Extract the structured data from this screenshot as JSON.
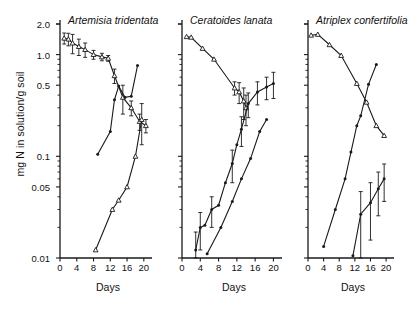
{
  "figure": {
    "ylabel": "mg N in solution/g soil",
    "xlabel": "Days",
    "y_tick_labels": [
      "2.0",
      "1.0",
      "0.5",
      "0.1",
      "0.05",
      "0.01"
    ],
    "x_tick_labels": [
      "0",
      "4",
      "8",
      "12",
      "16",
      "20"
    ]
  },
  "panels": [
    {
      "title": "Artemisia tridentata"
    },
    {
      "title": "Ceratoides lanata"
    },
    {
      "title": "Atriplex confertifolia"
    }
  ],
  "chart_data": {
    "type": "line",
    "title": "",
    "xlabel": "Days",
    "ylabel": "mg N in solution/g soil",
    "yscale": "log",
    "ylim": [
      0.01,
      2.0
    ],
    "xlim": [
      0,
      21
    ],
    "y_ticks": [
      2.0,
      1.0,
      0.5,
      0.1,
      0.05,
      0.01
    ],
    "x_ticks": [
      0,
      4,
      8,
      12,
      16,
      20
    ],
    "grid": false,
    "legend": "none",
    "panels": [
      {
        "title": "Artemisia tridentata",
        "series": [
          {
            "name": "declining-series",
            "marker": "open-triangle",
            "x": [
              1.0,
              2.0,
              3.0,
              4.5,
              6.0,
              8.0,
              10.0,
              11.5,
              13.0,
              15.0,
              17.0,
              19.0,
              20.5
            ],
            "y": [
              1.45,
              1.42,
              1.3,
              1.2,
              1.12,
              1.0,
              0.95,
              0.92,
              0.62,
              0.38,
              0.3,
              0.22,
              0.2
            ],
            "yerr": [
              0.18,
              0.2,
              0.28,
              0.22,
              0.18,
              0.1,
              0.08,
              0.06,
              0.1,
              0.12,
              0.05,
              0.04,
              0.03
            ]
          },
          {
            "name": "rising-series-upper",
            "marker": "filled-circle",
            "x": [
              9.0,
              12.0,
              13.0,
              14.0,
              15.5,
              17.0,
              18.5
            ],
            "y": [
              0.105,
              0.175,
              0.36,
              0.49,
              0.38,
              0.39,
              0.78
            ],
            "yerr": [
              0.0,
              0.0,
              0.0,
              0.0,
              0.0,
              0.0,
              0.0
            ]
          },
          {
            "name": "rising-series-lower",
            "marker": "open-triangle",
            "x": [
              8.5,
              12.5,
              14.0,
              16.0,
              18.0,
              19.5
            ],
            "y": [
              0.012,
              0.03,
              0.037,
              0.05,
              0.1,
              0.23
            ],
            "yerr": [
              0.0,
              0.0,
              0.0,
              0.0,
              0.0,
              0.1
            ]
          }
        ]
      },
      {
        "title": "Ceratoides lanata",
        "series": [
          {
            "name": "declining-series",
            "marker": "open-triangle",
            "x": [
              1.0,
              2.0,
              4.5,
              7.0,
              11.5,
              12.5,
              13.5,
              14.0
            ],
            "y": [
              1.5,
              1.48,
              1.15,
              0.9,
              0.47,
              0.43,
              0.35,
              0.3
            ],
            "yerr": [
              0.0,
              0.0,
              0.0,
              0.0,
              0.07,
              0.1,
              0.12,
              0.1
            ]
          },
          {
            "name": "rising-series-upper",
            "marker": "filled-circle",
            "x": [
              3.0,
              4.0,
              5.0,
              6.5,
              8.0,
              9.5,
              11.0,
              12.0,
              13.0,
              14.5,
              16.5,
              18.5,
              20.0
            ],
            "y": [
              0.012,
              0.02,
              0.021,
              0.03,
              0.033,
              0.055,
              0.085,
              0.13,
              0.185,
              0.33,
              0.43,
              0.48,
              0.52
            ],
            "yerr": [
              0.006,
              0.008,
              0.0,
              0.01,
              0.0,
              0.0,
              0.03,
              0.0,
              0.06,
              0.09,
              0.11,
              0.12,
              0.15
            ]
          },
          {
            "name": "rising-series-lower",
            "marker": "filled-circle",
            "x": [
              5.5,
              8.5,
              11.0,
              13.0,
              15.0,
              17.0,
              18.5
            ],
            "y": [
              0.011,
              0.02,
              0.036,
              0.06,
              0.095,
              0.175,
              0.23
            ],
            "yerr": [
              0.0,
              0.0,
              0.0,
              0.0,
              0.0,
              0.0,
              0.0
            ]
          }
        ]
      },
      {
        "title": "Atriplex confertifolia",
        "series": [
          {
            "name": "declining-series",
            "marker": "open-triangle",
            "x": [
              0.8,
              2.5,
              5.5,
              8.5,
              12.5,
              15.0,
              17.5,
              19.5
            ],
            "y": [
              1.55,
              1.58,
              1.25,
              0.98,
              0.52,
              0.34,
              0.2,
              0.16
            ],
            "yerr": [
              0.0,
              0.0,
              0.0,
              0.0,
              0.0,
              0.0,
              0.0,
              0.0
            ]
          },
          {
            "name": "rising-series-upper",
            "marker": "filled-circle",
            "x": [
              4.0,
              7.0,
              9.5,
              11.0,
              12.5,
              13.5,
              15.5,
              17.5
            ],
            "y": [
              0.013,
              0.03,
              0.06,
              0.11,
              0.2,
              0.25,
              0.51,
              0.8
            ],
            "yerr": [
              0.0,
              0.0,
              0.0,
              0.0,
              0.0,
              0.0,
              0.0,
              0.0
            ]
          },
          {
            "name": "rising-series-lower",
            "marker": "filled-circle",
            "x": [
              11.5,
              13.5,
              16.0,
              18.0,
              19.5
            ],
            "y": [
              0.0105,
              0.027,
              0.035,
              0.048,
              0.06
            ],
            "yerr": [
              0.0,
              0.018,
              0.02,
              0.022,
              0.024
            ]
          }
        ]
      }
    ]
  }
}
